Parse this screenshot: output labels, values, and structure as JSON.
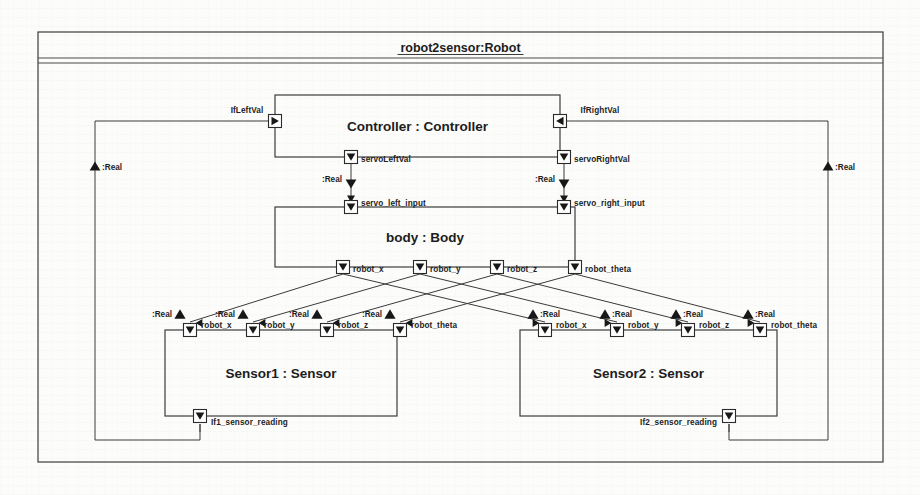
{
  "diagram": {
    "title": "robot2sensor:Robot",
    "type": "sysml-internal-block-diagram",
    "canvas": {
      "width": 920,
      "height": 495
    },
    "outer_frame": {
      "x": 38,
      "y": 32,
      "w": 845,
      "h": 430,
      "header_height": 30
    }
  },
  "blocks": [
    {
      "id": "controller",
      "label": "Controller : Controller",
      "x": 275,
      "y": 95,
      "w": 285,
      "h": 62
    },
    {
      "id": "body",
      "label": "body : Body",
      "x": 275,
      "y": 207,
      "w": 300,
      "h": 60
    },
    {
      "id": "sensor1",
      "label": "Sensor1 : Sensor",
      "x": 165,
      "y": 330,
      "w": 232,
      "h": 86
    },
    {
      "id": "sensor2",
      "label": "Sensor2 : Sensor",
      "x": 520,
      "y": 330,
      "w": 257,
      "h": 86
    }
  ],
  "ports": {
    "controller": [
      {
        "name": "IfLeftVal",
        "glyph": "arrow-right",
        "x": 275,
        "y": 121,
        "label_dx": -12,
        "label_dy": -9,
        "anchor": "end"
      },
      {
        "name": "IfRightVal",
        "glyph": "arrow-left",
        "x": 560,
        "y": 121,
        "label_dx": 12,
        "label_dy": -9,
        "anchor": "start"
      },
      {
        "name": "servoLeftVal",
        "glyph": "arrow-down",
        "x": 351,
        "y": 157,
        "label_dx": 10,
        "label_dy": 5,
        "anchor": "start"
      },
      {
        "name": "servoRightVal",
        "glyph": "arrow-down",
        "x": 564,
        "y": 157,
        "label_dx": 10,
        "label_dy": 5,
        "anchor": "start"
      }
    ],
    "body_top": [
      {
        "name": "servo_left_input",
        "glyph": "arrow-down",
        "x": 351,
        "y": 207,
        "label_dx": 10,
        "label_dy": -1,
        "anchor": "start"
      },
      {
        "name": "servo_right_input",
        "glyph": "arrow-down",
        "x": 564,
        "y": 207,
        "label_dx": 10,
        "label_dy": -1,
        "anchor": "start"
      }
    ],
    "body_bottom": [
      {
        "name": "robot_x",
        "glyph": "arrow-down",
        "x": 343,
        "y": 267,
        "label_dx": 10,
        "label_dy": 5,
        "anchor": "start"
      },
      {
        "name": "robot_y",
        "glyph": "arrow-down",
        "x": 420,
        "y": 267,
        "label_dx": 10,
        "label_dy": 5,
        "anchor": "start"
      },
      {
        "name": "robot_z",
        "glyph": "arrow-down",
        "x": 497,
        "y": 267,
        "label_dx": 10,
        "label_dy": 5,
        "anchor": "start"
      },
      {
        "name": "robot_theta",
        "glyph": "arrow-down",
        "x": 575,
        "y": 267,
        "label_dx": 10,
        "label_dy": 5,
        "anchor": "start"
      }
    ],
    "sensor1_top": [
      {
        "name": "robot_x",
        "glyph": "arrow-down",
        "x": 190,
        "y": 330,
        "label_dx": 11,
        "label_dy": -2,
        "anchor": "start"
      },
      {
        "name": "robot_y",
        "glyph": "arrow-down",
        "x": 253,
        "y": 330,
        "label_dx": 11,
        "label_dy": -2,
        "anchor": "start"
      },
      {
        "name": "robot_z",
        "glyph": "arrow-down",
        "x": 327,
        "y": 330,
        "label_dx": 11,
        "label_dy": -2,
        "anchor": "start"
      },
      {
        "name": "robot_theta",
        "glyph": "arrow-down",
        "x": 400,
        "y": 330,
        "label_dx": 11,
        "label_dy": -2,
        "anchor": "start"
      }
    ],
    "sensor2_top": [
      {
        "name": "robot_x",
        "glyph": "arrow-down",
        "x": 545,
        "y": 330,
        "label_dx": 11,
        "label_dy": -2,
        "anchor": "start"
      },
      {
        "name": "robot_y",
        "glyph": "arrow-down",
        "x": 617,
        "y": 330,
        "label_dx": 11,
        "label_dy": -2,
        "anchor": "start"
      },
      {
        "name": "robot_z",
        "glyph": "arrow-down",
        "x": 688,
        "y": 330,
        "label_dx": 11,
        "label_dy": -2,
        "anchor": "start"
      },
      {
        "name": "robot_theta",
        "glyph": "arrow-down",
        "x": 760,
        "y": 330,
        "label_dx": 11,
        "label_dy": -2,
        "anchor": "start"
      }
    ],
    "sensor_out": [
      {
        "name": "If1_sensor_reading",
        "glyph": "arrow-down",
        "x": 200,
        "y": 416,
        "label_dx": 11,
        "label_dy": 9,
        "anchor": "start"
      },
      {
        "name": "If2_sensor_reading",
        "glyph": "arrow-down",
        "x": 729,
        "y": 416,
        "label_dx": -12,
        "label_dy": 9,
        "anchor": "end"
      }
    ]
  },
  "type_labels": {
    "real": ":Real",
    "left_rail": {
      "x": 95,
      "y": 166
    },
    "right_rail": {
      "x": 828,
      "y": 166
    },
    "servo_left": {
      "x": 351,
      "y": 184
    },
    "servo_right": {
      "x": 564,
      "y": 184
    },
    "sensor1_rail": [
      {
        "x": 190,
        "y": 314
      },
      {
        "x": 253,
        "y": 314
      },
      {
        "x": 327,
        "y": 314
      },
      {
        "x": 400,
        "y": 314
      }
    ],
    "sensor2_rail": [
      {
        "x": 545,
        "y": 314
      },
      {
        "x": 617,
        "y": 314
      },
      {
        "x": 688,
        "y": 314
      },
      {
        "x": 760,
        "y": 314
      }
    ]
  },
  "connectors": [
    {
      "from": "If1_sensor_reading",
      "to": "IfLeftVal",
      "type": "flow",
      "flow_type": ":Real"
    },
    {
      "from": "If2_sensor_reading",
      "to": "IfRightVal",
      "type": "flow",
      "flow_type": ":Real"
    },
    {
      "from": "servoLeftVal",
      "to": "servo_left_input",
      "type": "flow",
      "flow_type": ":Real"
    },
    {
      "from": "servoRightVal",
      "to": "servo_right_input",
      "type": "flow",
      "flow_type": ":Real"
    },
    {
      "from": "body.robot_x",
      "to": "sensor1.robot_x",
      "type": "flow",
      "flow_type": ":Real"
    },
    {
      "from": "body.robot_y",
      "to": "sensor1.robot_y",
      "type": "flow",
      "flow_type": ":Real"
    },
    {
      "from": "body.robot_z",
      "to": "sensor1.robot_z",
      "type": "flow",
      "flow_type": ":Real"
    },
    {
      "from": "body.robot_theta",
      "to": "sensor1.robot_theta",
      "type": "flow",
      "flow_type": ":Real"
    },
    {
      "from": "body.robot_x",
      "to": "sensor2.robot_x",
      "type": "flow",
      "flow_type": ":Real"
    },
    {
      "from": "body.robot_y",
      "to": "sensor2.robot_y",
      "type": "flow",
      "flow_type": ":Real"
    },
    {
      "from": "body.robot_z",
      "to": "sensor2.robot_z",
      "type": "flow",
      "flow_type": ":Real"
    },
    {
      "from": "body.robot_theta",
      "to": "sensor2.robot_theta",
      "type": "flow",
      "flow_type": ":Real"
    }
  ]
}
